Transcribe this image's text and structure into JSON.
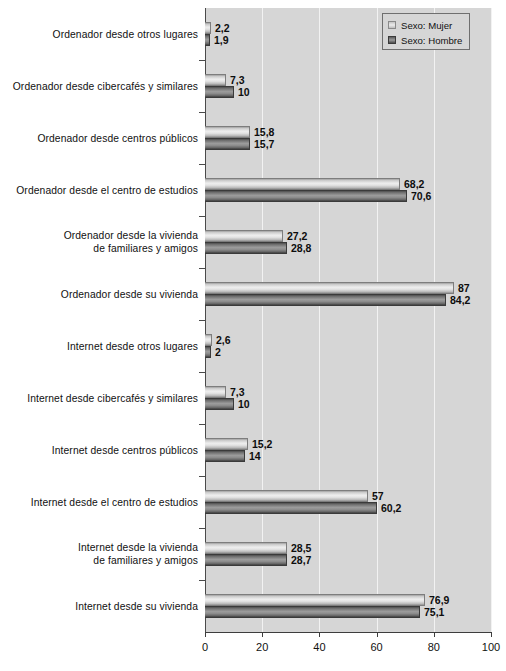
{
  "chart_data": {
    "type": "bar",
    "orientation": "horizontal",
    "title": "",
    "subtitle": "",
    "xlabel": "",
    "ylabel": "",
    "xlim": [
      0,
      100
    ],
    "xticks": [
      0,
      20,
      40,
      60,
      80,
      100
    ],
    "xtick_labels": [
      "0",
      "20",
      "40",
      "60",
      "80",
      "100"
    ],
    "grid": "vertical",
    "legend_position": "top-right",
    "categories": [
      "Ordenador desde otros lugares",
      "Ordenador desde cibercafés y similares",
      "Ordenador desde centros públicos",
      "Ordenador desde el centro de estudios",
      "Ordenador desde la vivienda de familiares y amigos",
      "Ordenador desde su vivienda",
      "Internet desde otros lugares",
      "Internet desde cibercafés y similares",
      "Internet desde centros públicos",
      "Internet desde el centro de estudios",
      "Internet desde la vivienda de familiares y amigos",
      "Internet desde su vivienda"
    ],
    "category_lines": [
      [
        "Ordenador desde otros lugares"
      ],
      [
        "Ordenador desde cibercafés y similares"
      ],
      [
        "Ordenador desde centros públicos"
      ],
      [
        "Ordenador desde el centro de estudios"
      ],
      [
        "Ordenador desde la vivienda",
        "de  familiares y amigos"
      ],
      [
        "Ordenador desde su vivienda"
      ],
      [
        "Internet desde otros lugares"
      ],
      [
        "Internet desde cibercafés y similares"
      ],
      [
        "Internet desde centros públicos"
      ],
      [
        "Internet desde el centro de estudios"
      ],
      [
        "Internet desde la vivienda",
        "de familiares y amigos"
      ],
      [
        "Internet desde su vivienda"
      ]
    ],
    "series": [
      {
        "name": "Sexo: Mujer",
        "color": "#e4e4e4",
        "values": [
          2.2,
          7.3,
          15.8,
          68.2,
          27.2,
          87,
          2.6,
          7.3,
          15.2,
          57,
          28.5,
          76.9
        ],
        "labels": [
          "2,2",
          "7,3",
          "15,8",
          "68,2",
          "27,2",
          "87",
          "2,6",
          "7,3",
          "15,2",
          "57",
          "28,5",
          "76,9"
        ]
      },
      {
        "name": "Sexo: Hombre",
        "color": "#8e8e8e",
        "values": [
          1.9,
          10,
          15.7,
          70.6,
          28.8,
          84.2,
          2,
          10,
          14,
          60.2,
          28.7,
          75.1
        ],
        "labels": [
          "1,9",
          "10",
          "15,7",
          "70,6",
          "28,8",
          "84,2",
          "2",
          "10",
          "14",
          "60,2",
          "28,7",
          "75,1"
        ]
      }
    ]
  },
  "legend": {
    "items": [
      {
        "label": "Sexo: Mujer",
        "swatch": "mujer"
      },
      {
        "label": "Sexo: Hombre",
        "swatch": "hombre"
      }
    ]
  },
  "colors": {
    "plot_background": "#d6d6d6",
    "page_background": "#ffffff",
    "gridline": "#f2f2f2",
    "axis": "#3d3d3d",
    "text": "#111111"
  }
}
